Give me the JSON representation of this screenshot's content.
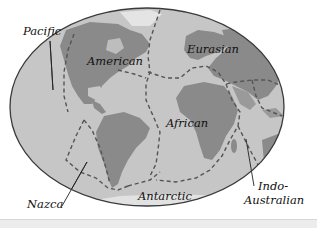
{
  "map": {
    "title": "Tectonic plates",
    "colors": {
      "ocean": "#c8c8c8",
      "land": "#8e8e8e",
      "land_light": "#a9a9a9",
      "ice": "#e6e6e6",
      "outline": "#3a3a3a",
      "boundary": "#555555",
      "background": "#ffffff"
    },
    "labels": {
      "pacific": "Pacific",
      "american": "American",
      "eurasian": "Eurasian",
      "african": "African",
      "nazca": "Nazca",
      "antarctic": "Antarctic",
      "indo": "Indo-",
      "australian": "Australian"
    }
  }
}
